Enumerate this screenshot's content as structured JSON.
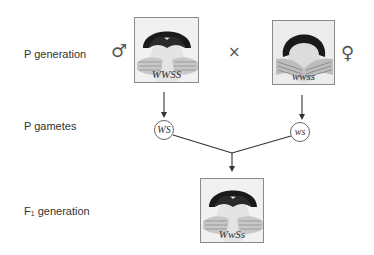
{
  "rows": {
    "p_generation": "P generation",
    "p_gametes": "P gametes",
    "f1_generation_prefix": "F",
    "f1_generation_sub": "1",
    "f1_generation_suffix": " generation"
  },
  "parents": {
    "male": {
      "sex_symbol": "♂",
      "genotype": "WWSS",
      "trait": "widow's peak, straight hair"
    },
    "female": {
      "sex_symbol": "♀",
      "genotype": "wwss",
      "trait": "no widow's peak, wavy hair"
    },
    "cross_symbol": "×"
  },
  "gametes": {
    "male": "WS",
    "female": "ws"
  },
  "offspring": {
    "f1": {
      "genotype": "WwSs"
    }
  },
  "colors": {
    "line": "#333333",
    "box_border": "#8a8a8a",
    "hair": "#1a1a1a",
    "skin": "#d8d8d8"
  }
}
